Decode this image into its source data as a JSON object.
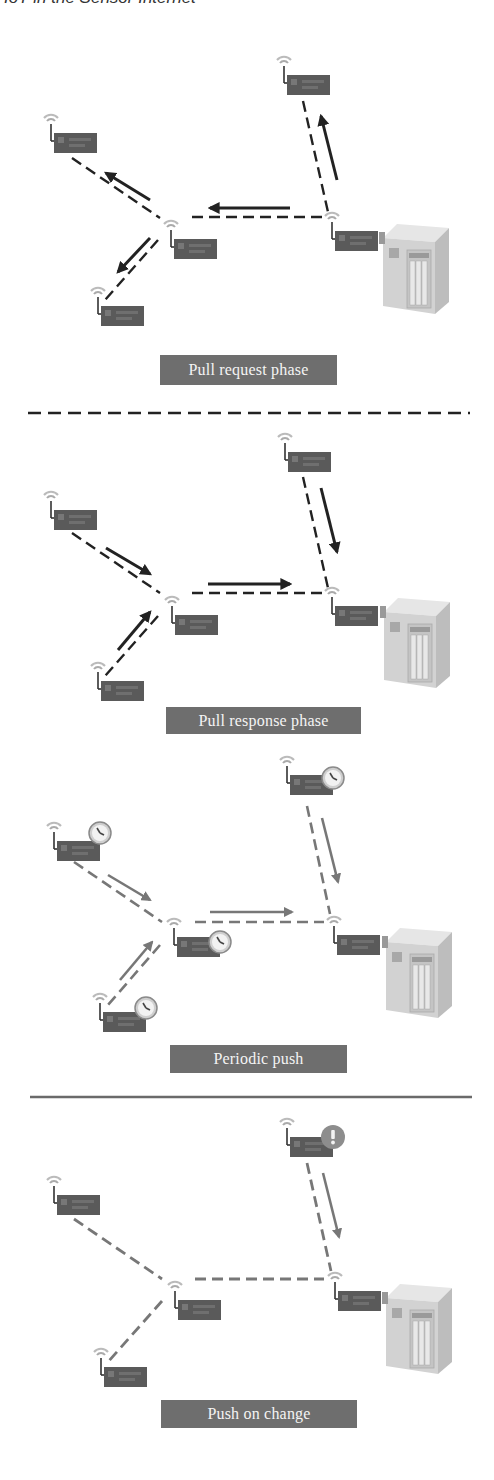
{
  "header": {
    "text": "IoT in the Sensor Internet"
  },
  "colors": {
    "black_link": "#222222",
    "gray_link": "#777777",
    "label_bg": "#6e6e6e",
    "label_text": "#f4f4f4",
    "node_box": "#555555",
    "server_body": "#d8d8d8"
  },
  "panels": [
    {
      "id": "pull-request",
      "label": "Pull request phase",
      "direction": "gateway-to-sensors",
      "link_style": "black",
      "node_badge": "none"
    },
    {
      "id": "pull-response",
      "label": "Pull response phase",
      "direction": "sensors-to-gateway",
      "link_style": "black",
      "node_badge": "none"
    },
    {
      "id": "periodic-push",
      "label": "Periodic push",
      "direction": "sensors-to-gateway",
      "link_style": "gray",
      "node_badge": "clock"
    },
    {
      "id": "push-on-change",
      "label": "Push on change",
      "direction": "one-sensor-to-gateway",
      "link_style": "gray",
      "node_badge": "exclamation"
    }
  ],
  "separators": [
    {
      "after": "pull-request",
      "style": "dashed"
    },
    {
      "after": "periodic-push",
      "style": "solid"
    }
  ],
  "legend": {
    "node_icon": "wireless-sensor-node-icon",
    "server_icon": "server-icon",
    "clock_icon": "clock-icon",
    "alert_icon": "exclamation-icon"
  }
}
